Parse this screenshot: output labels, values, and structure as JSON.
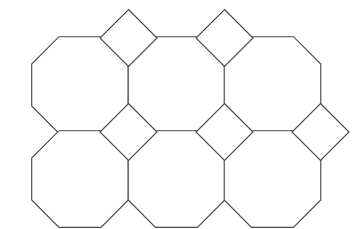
{
  "figure": {
    "name": "truncated-square-tiling",
    "width": 358,
    "height": 229,
    "background_color": "#ffffff",
    "stroke_color": "#4a4a4a",
    "fill_color": "#ffffff",
    "stroke_width": 1.15
  },
  "geometry": {
    "octagon_pitch_x": 96.5,
    "octagon_pitch_y": 94,
    "octagon_side": 42,
    "octagon_half_width": 48.3,
    "square_half_diagonal": 28.5,
    "octagon_rows": 2,
    "octagon_columns": 3,
    "octagon_count": 6,
    "square_count": 8
  },
  "octagons": [
    {
      "name": "octagon-r1c1",
      "cx": 80.0,
      "cy": 85.0
    },
    {
      "name": "octagon-r1c2",
      "cx": 176.5,
      "cy": 85.0
    },
    {
      "name": "octagon-r1c3",
      "cx": 272.5,
      "cy": 85.0
    },
    {
      "name": "octagon-r2c1",
      "cx": 80.0,
      "cy": 179.0
    },
    {
      "name": "octagon-r2c2",
      "cx": 176.5,
      "cy": 179.0
    },
    {
      "name": "octagon-r2c3",
      "cx": 272.5,
      "cy": 179.0
    }
  ],
  "squares": [
    {
      "name": "square-top-1",
      "cx": 128.5,
      "cy": 38.0
    },
    {
      "name": "square-top-2",
      "cx": 224.5,
      "cy": 38.0
    },
    {
      "name": "square-mid-1",
      "cx": 128.5,
      "cy": 132.0
    },
    {
      "name": "square-mid-2",
      "cx": 224.5,
      "cy": 132.0
    },
    {
      "name": "square-mid-3",
      "cx": 320.5,
      "cy": 132.0
    }
  ],
  "labels": {
    "caption": ""
  }
}
